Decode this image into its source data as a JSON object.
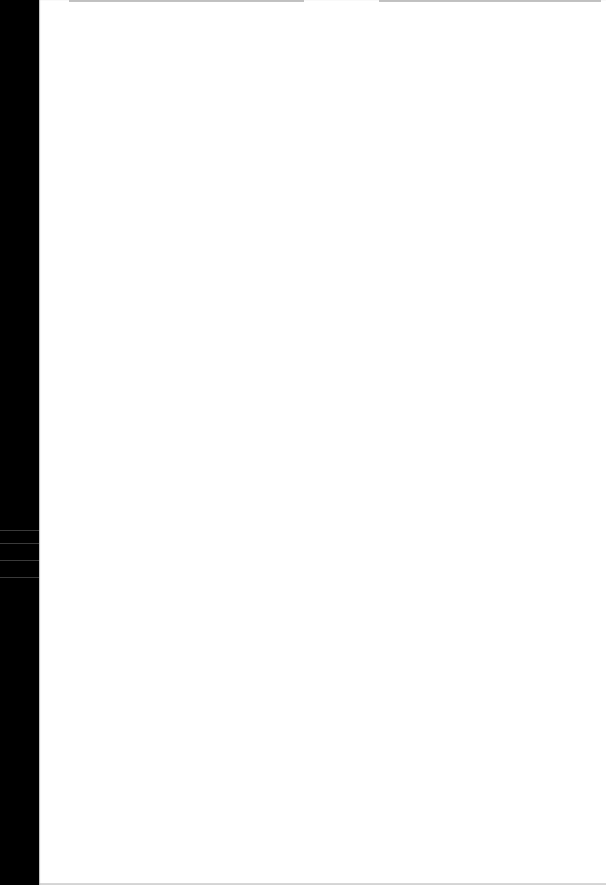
{
  "document": {
    "type": "scanned-page",
    "content": "",
    "colors": {
      "page": "#ffffff",
      "scan_border": "#000000"
    }
  }
}
